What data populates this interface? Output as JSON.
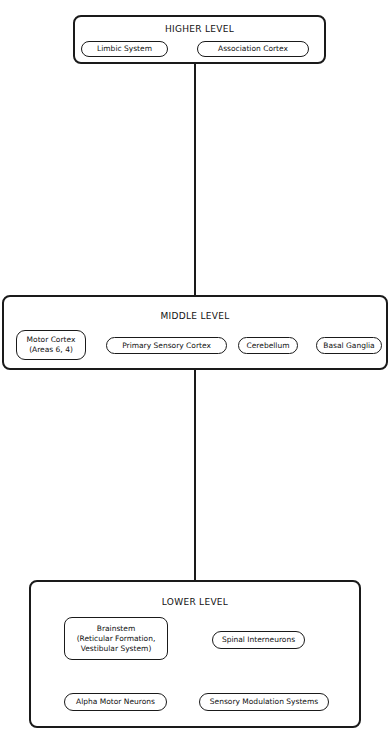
{
  "diagram": {
    "levels": [
      {
        "title": "HIGHER LEVEL",
        "nodes": [
          "Limbic System",
          "Association Cortex"
        ]
      },
      {
        "title": "MIDDLE LEVEL",
        "nodes": [
          "Motor Cortex\n(Areas 6, 4)",
          "Primary Sensory Cortex",
          "Cerebellum",
          "Basal Ganglia"
        ]
      },
      {
        "title": "LOWER LEVEL",
        "nodes": [
          "Brainstem\n(Reticular Formation,\nVestibular System)",
          "Spinal Interneurons",
          "Alpha Motor Neurons",
          "Sensory Modulation Systems"
        ]
      }
    ],
    "edges": [
      {
        "from": "HIGHER LEVEL",
        "to": "MIDDLE LEVEL"
      },
      {
        "from": "MIDDLE LEVEL",
        "to": "LOWER LEVEL"
      }
    ],
    "colors": {
      "stroke": "#1a1a1a",
      "background": "#ffffff"
    }
  }
}
